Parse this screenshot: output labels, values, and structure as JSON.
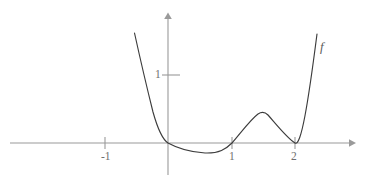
{
  "figure": {
    "kind": "function-graph",
    "background_color": "#ffffff",
    "axis_color": "#9a9a9a",
    "curve_color": "#3c3c3c",
    "label_color": "#6f6f6f",
    "width": 367,
    "height": 183
  },
  "labels": {
    "curve_name": "f",
    "x_tick_minus1": "-1",
    "x_tick_1": "1",
    "x_tick_2": "2",
    "y_tick_1": "1"
  },
  "chart_data": {
    "type": "line",
    "title": "",
    "xlabel": "",
    "ylabel": "",
    "legend": [
      "f"
    ],
    "grid": false,
    "legend_position": "curve-end-right",
    "xlim": [
      -2.4,
      3.0
    ],
    "ylim": [
      -0.45,
      3.6
    ],
    "x_ticks": [
      -1,
      1,
      2
    ],
    "x_tick_labels": [
      "-1",
      "1",
      "2"
    ],
    "y_ticks": [
      1
    ],
    "y_tick_labels": [
      "1"
    ],
    "axes": {
      "x_axis_pixel_y": 143,
      "y_axis_pixel_x": 168,
      "x_unit_pixels": 63.5,
      "y_unit_pixels": 68
    },
    "annotations": [
      "curve is tangent to the x-axis at x = 0",
      "curve crosses the x-axis at x = 1",
      "curve is tangent to the x-axis at x = 2",
      "local minimum between x = 0 and x = 1",
      "local maximum between x = 1 and x = 2"
    ],
    "series": [
      {
        "name": "f",
        "x": [
          -0.55,
          -0.5,
          -0.45,
          -0.4,
          -0.35,
          -0.3,
          -0.25,
          -0.2,
          -0.15,
          -0.1,
          -0.05,
          0.0,
          0.1,
          0.2,
          0.3,
          0.4,
          0.5,
          0.58,
          0.7,
          0.8,
          0.9,
          1.0,
          1.1,
          1.2,
          1.3,
          1.4,
          1.5,
          1.55,
          1.65,
          1.75,
          1.85,
          1.95,
          2.0,
          2.1,
          2.2,
          2.3,
          2.35
        ],
        "y": [
          1.62,
          1.32,
          1.05,
          0.8,
          0.58,
          0.4,
          0.26,
          0.15,
          0.08,
          0.03,
          0.01,
          0.0,
          -0.03,
          -0.07,
          -0.11,
          -0.14,
          -0.15,
          -0.155,
          -0.14,
          -0.11,
          -0.06,
          0.0,
          0.08,
          0.2,
          0.32,
          0.4,
          0.43,
          0.435,
          0.4,
          0.31,
          0.18,
          0.04,
          0.0,
          0.18,
          0.62,
          1.28,
          1.66
        ]
      }
    ],
    "curve_pixel_path": "M 134.5,33 C 140,58 147,88 153,112 C 158,130 162,139 168,143 C 177,148 188,152 205,153 C 219,153.5 226,149 232,143 C 240,134 250,120 258,114 C 261,112 265,112 268,115 C 276,124 287,138 295,143 C 301,147 308,104 317,34"
  }
}
